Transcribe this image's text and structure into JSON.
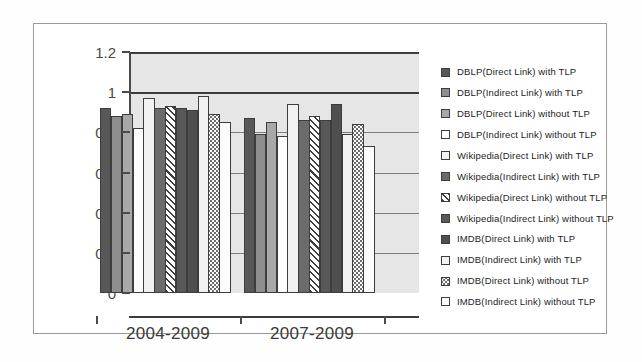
{
  "chart_data": {
    "type": "bar",
    "title": "",
    "xlabel": "",
    "ylabel": "",
    "categories": [
      "2004-2009",
      "2007-2009"
    ],
    "ylim": [
      0,
      1.2
    ],
    "ytick_labels": [
      "0",
      "0.2",
      "0.4",
      "0.6",
      "0.8",
      "1",
      "1.2"
    ],
    "ytick_values": [
      0,
      0.2,
      0.4,
      0.6,
      0.8,
      1,
      1.2
    ],
    "grid": true,
    "legend_position": "right",
    "series": [
      {
        "name": "DBLP(Direct Link) with TLP",
        "fill": "f-darkgray",
        "values": [
          0.92,
          0.87
        ]
      },
      {
        "name": "DBLP(Indirect Link) with TLP",
        "fill": "f-midgray",
        "values": [
          0.88,
          0.79
        ]
      },
      {
        "name": "DBLP(Direct Link) without TLP",
        "fill": "f-gray",
        "values": [
          0.89,
          0.85
        ]
      },
      {
        "name": "DBLP(Indirect Link) without TLP",
        "fill": "f-white",
        "values": [
          0.82,
          0.78
        ]
      },
      {
        "name": "Wikipedia(Direct Link) with TLP",
        "fill": "f-offwhite",
        "values": [
          0.97,
          0.94
        ]
      },
      {
        "name": "Wikipedia(Indirect Link) with TLP",
        "fill": "f-dark2",
        "values": [
          0.92,
          0.86
        ]
      },
      {
        "name": "Wikipedia(Direct Link) without TLP",
        "fill": "f-hatch",
        "values": [
          0.93,
          0.88
        ]
      },
      {
        "name": "Wikipedia(Indirect Link) without TLP",
        "fill": "f-darkgray",
        "values": [
          0.92,
          0.86
        ]
      },
      {
        "name": "IMDB(Direct Link) with TLP",
        "fill": "f-dark3",
        "values": [
          0.91,
          0.94
        ]
      },
      {
        "name": "IMDB(Indirect Link) with TLP",
        "fill": "f-offwhite",
        "values": [
          0.98,
          0.79
        ]
      },
      {
        "name": "IMDB(Direct Link) without TLP",
        "fill": "f-dots",
        "values": [
          0.89,
          0.84
        ]
      },
      {
        "name": "IMDB(Indirect Link) without TLP",
        "fill": "f-white",
        "values": [
          0.85,
          0.73
        ]
      }
    ]
  },
  "legend": {
    "items": [
      {
        "label": "DBLP(Direct Link) with TLP",
        "swatch": "f-darkgray"
      },
      {
        "label": "DBLP(Indirect Link) with TLP",
        "swatch": "f-midgray"
      },
      {
        "label": "DBLP(Direct Link) without TLP",
        "swatch": "f-gray"
      },
      {
        "label": "DBLP(Indirect Link) without TLP",
        "swatch": "f-white"
      },
      {
        "label": "Wikipedia(Direct Link) with TLP",
        "swatch": "f-offwhite"
      },
      {
        "label": "Wikipedia(Indirect Link) with TLP",
        "swatch": "f-dark2"
      },
      {
        "label": "Wikipedia(Direct Link) without TLP",
        "swatch": "f-hatch"
      },
      {
        "label": "Wikipedia(Indirect Link) without TLP",
        "swatch": "f-darkgray"
      },
      {
        "label": "IMDB(Direct Link) with TLP",
        "swatch": "f-dark3"
      },
      {
        "label": "IMDB(Indirect Link) with TLP",
        "swatch": "f-offwhite"
      },
      {
        "label": "IMDB(Direct Link) without TLP",
        "swatch": "f-dots"
      },
      {
        "label": "IMDB(Indirect Link) without TLP",
        "swatch": "f-white"
      }
    ]
  },
  "colors": {
    "axis": "#3c3c3c",
    "gridline": "#7d7d7d",
    "plot_background": "#e6e6e6",
    "frame_border": "#9a9a9a",
    "text": "#1d1d1d"
  }
}
